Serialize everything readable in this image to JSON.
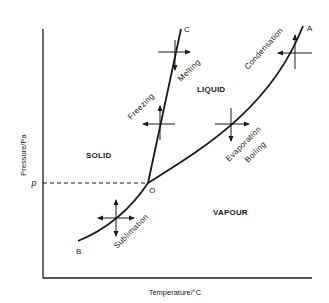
{
  "diagram": {
    "title": "",
    "axes": {
      "x_label": "Temperature/°C",
      "y_label": "Pressure/Pa",
      "y_marker": "p"
    },
    "regions": {
      "solid": "SOLID",
      "liquid": "LIQUID",
      "vapour": "VAPOUR"
    },
    "points": {
      "triple": "O",
      "fusion_end": "C",
      "vaporization_end": "A",
      "sublimation_end": "B"
    },
    "processes": {
      "freezing": "Freezing",
      "melting": "Melting",
      "condensation": "Condensation",
      "evaporation": "Evaporation",
      "boiling": "Boiling",
      "sublimation": "Sublimation"
    },
    "colors": {
      "line": "#1a1a1a",
      "background": "#ffffff"
    }
  }
}
